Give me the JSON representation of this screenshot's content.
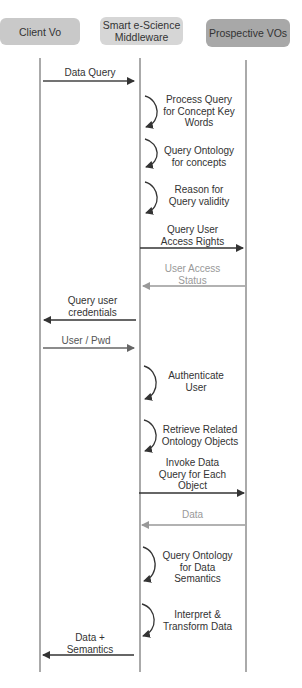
{
  "actors": [
    {
      "id": "client",
      "label": "Client Vo",
      "color": "#c8c8c8"
    },
    {
      "id": "middleware",
      "label": "Smart e-Science Middleware",
      "color": "#d4d4d4"
    },
    {
      "id": "vos",
      "label": "Prospective VOs",
      "color": "#a9a9a9"
    }
  ],
  "messages": [
    {
      "type": "arrow",
      "from": "client",
      "to": "middleware",
      "label": "Data Query",
      "style": "dark"
    },
    {
      "type": "self",
      "on": "middleware",
      "label": "Process Query for Concept Key Words"
    },
    {
      "type": "self",
      "on": "middleware",
      "label": "Query Ontology for concepts"
    },
    {
      "type": "self",
      "on": "middleware",
      "label": "Reason for Query validity"
    },
    {
      "type": "arrow",
      "from": "middleware",
      "to": "vos",
      "label": "Query User Access Rights",
      "style": "dark"
    },
    {
      "type": "arrow",
      "from": "vos",
      "to": "middleware",
      "label": "User Access Status",
      "style": "light"
    },
    {
      "type": "arrow",
      "from": "middleware",
      "to": "client",
      "label": "Query user credentials",
      "style": "dark"
    },
    {
      "type": "arrow",
      "from": "client",
      "to": "middleware",
      "label": "User / Pwd",
      "style": "medium"
    },
    {
      "type": "self",
      "on": "middleware",
      "label": "Authenticate User"
    },
    {
      "type": "self",
      "on": "middleware",
      "label": "Retrieve Related Ontology Objects"
    },
    {
      "type": "arrow",
      "from": "middleware",
      "to": "vos",
      "label": "Invoke Data Query for Each Object",
      "style": "dark"
    },
    {
      "type": "arrow",
      "from": "vos",
      "to": "middleware",
      "label": "Data",
      "style": "light"
    },
    {
      "type": "self",
      "on": "middleware",
      "label": "Query Ontology for Data Semantics"
    },
    {
      "type": "self",
      "on": "middleware",
      "label": "Interpret & Transform Data"
    },
    {
      "type": "arrow",
      "from": "middleware",
      "to": "client",
      "label": "Data + Semantics",
      "style": "dark"
    }
  ],
  "labels": {
    "m0": "Data Query",
    "s1a": "Process Query",
    "s1b": "for Concept Key",
    "s1c": "Words",
    "s2a": "Query Ontology",
    "s2b": "for concepts",
    "s3a": "Reason for",
    "s3b": "Query validity",
    "m4a": "Query User",
    "m4b": "Access Rights",
    "m5a": "User Access",
    "m5b": "Status",
    "m6a": "Query user",
    "m6b": "credentials",
    "m7": "User / Pwd",
    "s8a": "Authenticate",
    "s8b": "User",
    "s9a": "Retrieve Related",
    "s9b": "Ontology Objects",
    "m10a": "Invoke Data",
    "m10b": "Query for Each",
    "m10c": "Object",
    "m11": "Data",
    "s12a": "Query Ontology",
    "s12b": "for Data",
    "s12c": "Semantics",
    "s13a": "Interpret &",
    "s13b": "Transform Data",
    "m14a": "Data +",
    "m14b": "Semantics"
  }
}
